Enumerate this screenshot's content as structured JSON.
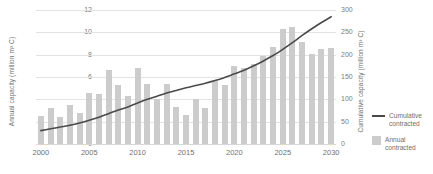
{
  "chart_data": {
    "type": "bar",
    "title": "",
    "xlabel": "",
    "ylabel": "Annual capacity (million m³ C)",
    "y2label": "Cumulative capacity (million m³ C)",
    "grid": true,
    "legend_position": "right",
    "categories": [
      2000,
      2001,
      2002,
      2003,
      2004,
      2005,
      2006,
      2007,
      2008,
      2009,
      2010,
      2011,
      2012,
      2013,
      2014,
      2015,
      2016,
      2017,
      2018,
      2019,
      2020,
      2021,
      2022,
      2023,
      2024,
      2025,
      2026,
      2027,
      2028,
      2029,
      2030
    ],
    "x_tick_labels": [
      "2000",
      "2005",
      "2010",
      "2015",
      "2020",
      "2025",
      "2030"
    ],
    "x_tick_values": [
      2000,
      2005,
      2010,
      2015,
      2020,
      2025,
      2030
    ],
    "ylim": [
      0,
      12
    ],
    "y_tick_labels": [
      "0",
      "2",
      "4",
      "6",
      "8",
      "10",
      "12"
    ],
    "y_tick_values": [
      0,
      2,
      4,
      6,
      8,
      10,
      12
    ],
    "y2lim": [
      0,
      300
    ],
    "y2_tick_labels": [
      "0",
      "50",
      "100",
      "150",
      "200",
      "250",
      "300"
    ],
    "y2_tick_values": [
      0,
      50,
      100,
      150,
      200,
      250,
      300
    ],
    "series": [
      {
        "name": "Annual contracted",
        "type": "bar",
        "axis": "left",
        "color": "#cccccc",
        "values": [
          2.5,
          3.2,
          2.4,
          3.5,
          2.8,
          4.6,
          4.5,
          6.6,
          5.3,
          4.3,
          6.8,
          5.4,
          4.0,
          5.4,
          3.3,
          2.6,
          4.0,
          3.2,
          5.6,
          5.3,
          7.0,
          6.8,
          7.2,
          7.9,
          8.7,
          10.3,
          10.5,
          9.1,
          8.1,
          8.5,
          8.6
        ]
      },
      {
        "name": "Cumulative contracted",
        "type": "line",
        "axis": "right",
        "color": "#4a4a4a",
        "values": [
          30,
          34,
          38,
          42,
          47,
          53,
          60,
          68,
          76,
          83,
          92,
          100,
          107,
          114,
          120,
          126,
          131,
          136,
          142,
          149,
          157,
          165,
          175,
          186,
          198,
          212,
          227,
          243,
          258,
          272,
          285
        ]
      }
    ],
    "legend": [
      {
        "label": "Cumulative contracted",
        "marker": "line",
        "color": "#4a4a4a"
      },
      {
        "label": "Annual contracted",
        "marker": "swatch",
        "color": "#cccccc"
      }
    ]
  }
}
